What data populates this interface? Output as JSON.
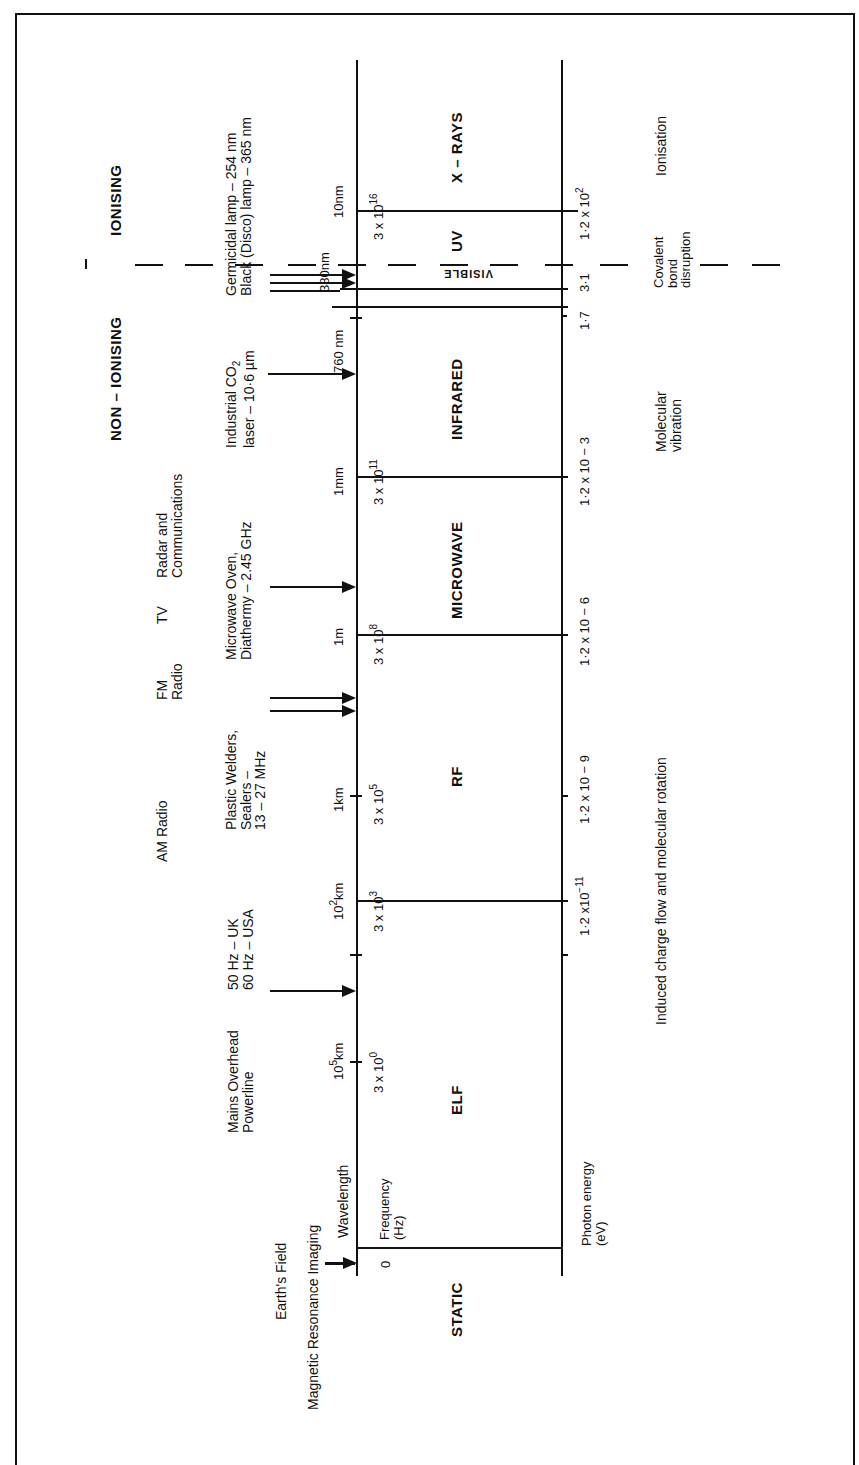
{
  "classification": {
    "non_ionising": "NON – IONISING",
    "ionising": "IONISING"
  },
  "axis_labels": {
    "wavelength": "Wavelength",
    "frequency": "Frequency",
    "frequency_unit": "(Hz)",
    "photon_energy": "Photon energy",
    "photon_energy_unit": "(eV)",
    "zero": "0"
  },
  "bands": [
    {
      "name": "STATIC"
    },
    {
      "name": "ELF"
    },
    {
      "name": "RF"
    },
    {
      "name": "MICROWAVE"
    },
    {
      "name": "INFRARED"
    },
    {
      "name": "VISIBLE"
    },
    {
      "name": "UV"
    },
    {
      "name": "X – RAYS"
    }
  ],
  "wavelength_ticks": [
    {
      "base": "10",
      "exp": "5",
      "unit": "km"
    },
    {
      "base": "10",
      "exp": "2",
      "unit": "km"
    },
    {
      "label": "1km"
    },
    {
      "label": "1m"
    },
    {
      "label": "1mm"
    },
    {
      "label": "760 nm"
    },
    {
      "label": "380nm"
    },
    {
      "label": "10nm"
    }
  ],
  "frequency_ticks": [
    {
      "mant": "3 x ",
      "base": "10",
      "exp": "0"
    },
    {
      "mant": "3 x ",
      "base": "10",
      "exp": "3"
    },
    {
      "mant": "3 x ",
      "base": "10",
      "exp": "5"
    },
    {
      "mant": "3 x ",
      "base": "10",
      "exp": "8"
    },
    {
      "mant": "3 x ",
      "base": "10",
      "exp": "11"
    },
    {
      "mant": "3 x ",
      "base": "10",
      "exp": "16"
    }
  ],
  "energy_ticks": [
    {
      "mant": "1·2 x",
      "base": "10",
      "exp": "−11"
    },
    {
      "label": "1·2 x 10 − 9"
    },
    {
      "label": "1·2 x 10 − 6"
    },
    {
      "label": "1·2 x 10 − 3"
    },
    {
      "label": "1·7"
    },
    {
      "label": "3·1"
    },
    {
      "mant": "1·2 x ",
      "base": "10",
      "exp": "2"
    }
  ],
  "sources": {
    "earths_field": "Earth's  Field",
    "mri": "Magnetic Resonance Imaging",
    "mains_line1": "Mains Overhead",
    "mains_line2": "Powerline",
    "mains_uk": "50 Hz – UK",
    "mains_usa": "60 Hz – USA",
    "am_radio": "AM  Radio",
    "fm_line1": "FM",
    "fm_line2": "Radio",
    "tv": "TV",
    "radar_line1": "Radar  and",
    "radar_line2": "Communications",
    "plastic_line1": "Plastic  Welders,",
    "plastic_line2": "Sealers –",
    "plastic_line3": "13 – 27 MHz",
    "microwave_line1": "Microwave  Oven,",
    "microwave_line2": "Diathermy – 2.45 GHz",
    "co2_line1": "Industrial  CO",
    "co2_sub": "2",
    "co2_line2": "laser – 10·6 µm",
    "germicidal": "Germicidal  lamp – 254 nm",
    "black_disco": "Black  (Disco)  lamp – 365 nm"
  },
  "effects": {
    "induced": "Induced   charge   flow   and   molecular   rotation",
    "molecular_line1": "Molecular",
    "molecular_line2": "vibration",
    "covalent_line1": "Covalent",
    "covalent_line2": "bond",
    "covalent_line3": "disruption",
    "ionisation": "Ionisation"
  }
}
